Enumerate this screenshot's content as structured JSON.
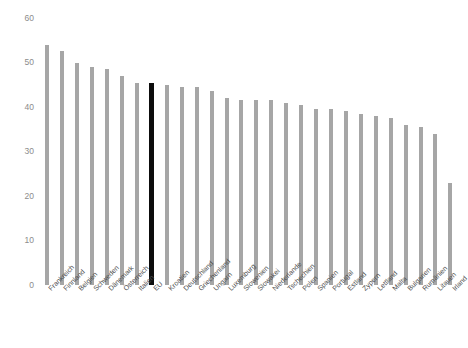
{
  "chart_data": {
    "type": "bar",
    "title": "",
    "subtitle": "",
    "xlabel": "",
    "ylabel": "",
    "ylim": [
      0,
      60
    ],
    "grid": false,
    "legend": "none",
    "y_ticks": [
      60,
      50,
      40,
      30,
      20,
      10,
      0
    ],
    "categories": [
      "Frankreich",
      "Finnland",
      "Belgien",
      "Schweden",
      "Dänemark",
      "Österreich",
      "Italien",
      "EU",
      "Kroatien",
      "Deutschland",
      "Griechenland",
      "Ungarn",
      "Luxemburg",
      "Slowenien",
      "Slowakei",
      "Niederlande",
      "Tschechien",
      "Polen",
      "Spanien",
      "Portugal",
      "Estland",
      "Zypern",
      "Lettland",
      "Malta",
      "Bulgarien",
      "Rumänien",
      "Litauen",
      "Irland"
    ],
    "values": [
      54.0,
      52.5,
      50.0,
      49.0,
      48.5,
      47.0,
      45.5,
      45.5,
      45.0,
      44.5,
      44.5,
      43.5,
      42.0,
      41.5,
      41.5,
      41.5,
      41.0,
      40.5,
      39.5,
      39.5,
      39.0,
      38.5,
      38.0,
      37.5,
      36.0,
      35.5,
      34.0,
      23.0
    ],
    "highlight_category": "EU",
    "colors": {
      "bar": "#a6a6a6",
      "bar_highlight": "#0d0d0d",
      "axis_text": "#8c8c8c",
      "category_text": "#4d4d4d",
      "background": "#ffffff"
    }
  }
}
